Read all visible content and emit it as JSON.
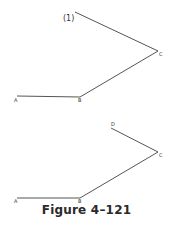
{
  "figure": {
    "caption": "Figure 4–121",
    "line_color": "#555555"
  },
  "diagram_top": {
    "step_label": "(1)",
    "points": {
      "A": {
        "label": "A"
      },
      "B": {
        "label": "B"
      },
      "C": {
        "label": "C"
      }
    }
  },
  "diagram_bottom": {
    "points": {
      "A": {
        "label": "A"
      },
      "B": {
        "label": "B"
      },
      "C": {
        "label": "C"
      },
      "D": {
        "label": "D"
      }
    }
  }
}
